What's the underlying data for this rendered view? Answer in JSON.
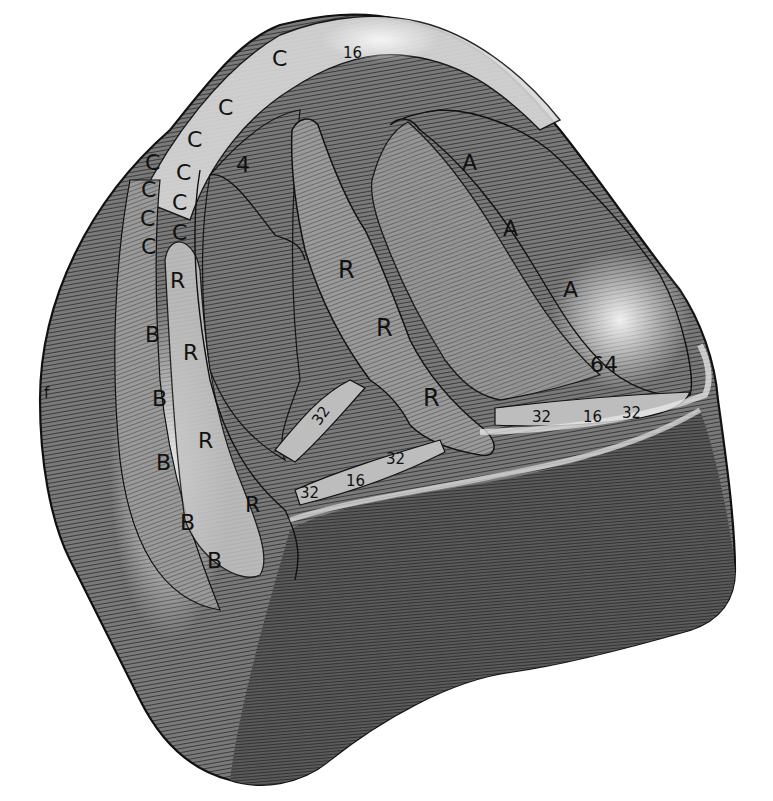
{
  "figure": {
    "colors": {
      "ink": "#111111",
      "shade_dark": "#4a4a4a",
      "shade_mid": "#6e6e6e",
      "shade_light": "#a8a8a8",
      "highlight": "#dcdcdc",
      "paper": "#ffffff"
    },
    "labels": {
      "top_c": "C",
      "top_16": "16",
      "c_outer": [
        "C",
        "C",
        "C",
        "C"
      ],
      "c_inner": [
        "C",
        "C",
        "C",
        "C",
        "C"
      ],
      "c_upper": "C",
      "four": "4",
      "r_left": [
        "R",
        "R",
        "R",
        "R"
      ],
      "r_center": [
        "R",
        "R",
        "R"
      ],
      "b_left": [
        "B",
        "B",
        "B",
        "B",
        "B"
      ],
      "a_right": [
        "A",
        "A",
        "A"
      ],
      "sixty_four": "64",
      "right_band": [
        "32",
        "16",
        "32"
      ],
      "center_band": [
        "32",
        "16",
        "32"
      ],
      "upper_32": "32",
      "edge_f": "f"
    }
  }
}
